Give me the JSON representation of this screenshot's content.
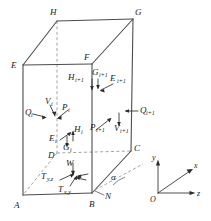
{
  "figure": {
    "type": "engineering-diagram",
    "background_color": "#ffffff",
    "line_color": "#4d4d4d",
    "text_color": "#1a1a1a"
  },
  "vertices": {
    "A": {
      "label": "A",
      "x": 23,
      "y": 195
    },
    "B": {
      "label": "B",
      "x": 92,
      "y": 193
    },
    "C": {
      "label": "C",
      "x": 131,
      "y": 151
    },
    "D": {
      "label": "D",
      "x": 57,
      "y": 153
    },
    "E": {
      "label": "E",
      "x": 23,
      "y": 65
    },
    "F": {
      "label": "F",
      "x": 92,
      "y": 64
    },
    "G": {
      "label": "G",
      "x": 133,
      "y": 19
    },
    "H": {
      "label": "H",
      "x": 57,
      "y": 21
    }
  },
  "vertex_labels": [
    {
      "name": "vertex-H",
      "text": "H",
      "x": 50,
      "y": 15
    },
    {
      "name": "vertex-G",
      "text": "G",
      "x": 135,
      "y": 15
    },
    {
      "name": "vertex-E",
      "text": "E",
      "x": 12,
      "y": 64
    },
    {
      "name": "vertex-F",
      "text": "F",
      "x": 86,
      "y": 60
    },
    {
      "name": "vertex-D",
      "text": "D",
      "x": 50,
      "y": 157
    },
    {
      "name": "vertex-C",
      "text": "C",
      "x": 133,
      "y": 150
    },
    {
      "name": "vertex-A",
      "text": "A",
      "x": 16,
      "y": 205
    },
    {
      "name": "vertex-B",
      "text": "B",
      "x": 90,
      "y": 205
    }
  ],
  "force_labels": [
    {
      "name": "force-V-i",
      "base": "V",
      "sub": "i",
      "x": 47,
      "y": 101
    },
    {
      "name": "force-P-i",
      "base": "P",
      "sub": "i",
      "x": 61,
      "y": 107
    },
    {
      "name": "force-Q-i",
      "base": "Q",
      "sub": "i",
      "x": 28,
      "y": 114
    },
    {
      "name": "force-Q-i1",
      "base": "Q",
      "sub": "i+1",
      "x": 140,
      "y": 113
    },
    {
      "name": "force-V-i1",
      "base": "V",
      "sub": "i+1",
      "x": 117,
      "y": 130
    },
    {
      "name": "force-P-i1",
      "base": "P",
      "sub": "i+1",
      "x": 95,
      "y": 128
    },
    {
      "name": "force-E-i",
      "base": "E",
      "sub": "i",
      "x": 53,
      "y": 140
    },
    {
      "name": "force-H-i",
      "base": "H",
      "sub": "i",
      "x": 79,
      "y": 132
    },
    {
      "name": "force-G-i",
      "base": "G",
      "sub": "i",
      "x": 70,
      "y": 148
    },
    {
      "name": "force-H-i1",
      "base": "H",
      "sub": "i+1",
      "x": 73,
      "y": 82
    },
    {
      "name": "force-G-i1",
      "base": "G",
      "sub": "i+1",
      "x": 94,
      "y": 76
    },
    {
      "name": "force-E-i1",
      "base": "E",
      "sub": "i+1",
      "x": 113,
      "y": 81
    },
    {
      "name": "force-W",
      "base": "W",
      "sub": "",
      "x": 66,
      "y": 166
    },
    {
      "name": "force-T-yz",
      "base": "T",
      "sub": "y,z",
      "x": 45,
      "y": 178
    },
    {
      "name": "force-T-xy",
      "base": "T",
      "sub": "x,y",
      "x": 62,
      "y": 191
    },
    {
      "name": "force-N",
      "base": "N",
      "sub": "",
      "x": 106,
      "y": 196
    },
    {
      "name": "angle-alpha",
      "base": "α",
      "sub": "",
      "x": 113,
      "y": 178
    }
  ],
  "axes": {
    "name": "coordinate-triad",
    "origin": {
      "label": "O",
      "x": 158,
      "y": 196
    },
    "items": [
      {
        "name": "axis-y",
        "label": "y",
        "direction": "up",
        "x": 154,
        "y": 156
      },
      {
        "name": "axis-x",
        "label": "x",
        "direction": "up-right-diag",
        "x": 196,
        "y": 166
      },
      {
        "name": "axis-z",
        "label": "z",
        "direction": "right",
        "x": 198,
        "y": 193
      }
    ]
  }
}
